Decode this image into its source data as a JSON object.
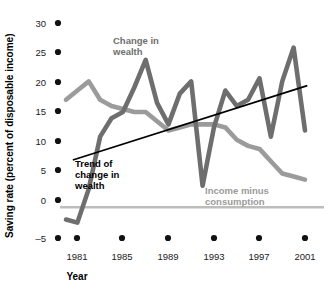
{
  "chart_data": {
    "type": "line",
    "title": "",
    "xlabel": "Year",
    "ylabel": "Saving rate (percent of disposable income)",
    "xlim": [
      1980,
      2001
    ],
    "ylim": [
      -5,
      30
    ],
    "grid": false,
    "legend_position": "inline-annotations",
    "y_ticks": [
      30,
      25,
      20,
      15,
      10,
      5,
      0,
      -5
    ],
    "y_tick_labels": [
      "30",
      "25",
      "20",
      "15",
      "10",
      "5",
      "0",
      "-5"
    ],
    "x_ticks": [
      1981,
      1985,
      1989,
      1993,
      1997,
      2001
    ],
    "x_tick_labels": [
      "1981",
      "1985",
      "1989",
      "1993",
      "1997",
      "2001"
    ],
    "zero_line": 0,
    "x": [
      1980,
      1981,
      1982,
      1983,
      1984,
      1985,
      1986,
      1987,
      1988,
      1989,
      1990,
      1991,
      1992,
      1993,
      1994,
      1995,
      1996,
      1997,
      1998,
      1999,
      2000,
      2001
    ],
    "series": [
      {
        "name": "Change in wealth",
        "color": "#6e6e6e",
        "values": [
          -2.0,
          -2.5,
          3.0,
          11.5,
          14.5,
          15.5,
          19.5,
          24.0,
          17.0,
          13.5,
          18.5,
          20.5,
          3.5,
          13.0,
          19.0,
          16.5,
          17.5,
          21.0,
          11.5,
          20.5,
          26.0,
          12.5
        ]
      },
      {
        "name": "Income minus consumption",
        "color": "#9b9b9b",
        "values": [
          17.5,
          19.0,
          20.5,
          17.5,
          16.5,
          16.0,
          15.5,
          15.5,
          14.0,
          12.5,
          13.0,
          13.5,
          13.5,
          13.5,
          13.0,
          11.0,
          10.0,
          9.5,
          7.5,
          5.5,
          5.0,
          4.5
        ]
      }
    ],
    "trend_line": {
      "name": "Trend of change in wealth",
      "color": "#000000",
      "x_start": 1980.6,
      "y_start": 7.7,
      "x_end": 2001.2,
      "y_end": 19.8
    },
    "annotations": [
      {
        "text_line1": "Change in",
        "text_line2": "wealth",
        "series": "Change in wealth",
        "x_px": 113,
        "y_px": 44
      },
      {
        "text_line1": "Trend of",
        "text_line2": "change in",
        "text_line3": "wealth",
        "series": "Trend of change in wealth",
        "x_px": 75,
        "y_px": 165
      },
      {
        "text_line1": "Income minus",
        "text_line2": "consumption",
        "series": "Income minus consumption",
        "x_px": 205,
        "y_px": 193
      }
    ]
  },
  "labels": {
    "y_axis_title": "Saving rate (percent of disposable income)",
    "x_axis_title": "Year",
    "change_in_wealth_l1": "Change in",
    "change_in_wealth_l2": "wealth",
    "trend_l1": "Trend of",
    "trend_l2": "change in",
    "trend_l3": "wealth",
    "income_minus_l1": "Income minus",
    "income_minus_l2": "consumption",
    "y30": "30",
    "y25": "25",
    "y20": "20",
    "y15": "15",
    "y10": "10",
    "y5": "5",
    "y0": "0",
    "ym5": "–5",
    "x1981": "1981",
    "x1985": "1985",
    "x1989": "1989",
    "x1993": "1993",
    "x1997": "1997",
    "x2001": "2001"
  },
  "colors": {
    "change_in_wealth": "#6e6e6e",
    "income_minus_consumption": "#9b9b9b",
    "trend": "#000000",
    "zero_line": "#bdbdbd",
    "text": "#000000",
    "background": "#ffffff"
  }
}
